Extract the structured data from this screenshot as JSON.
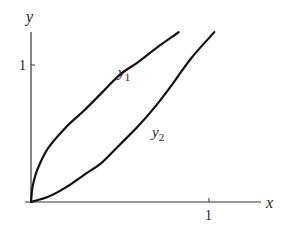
{
  "chart_data": {
    "type": "line",
    "title": "",
    "xlabel": "x",
    "ylabel": "y",
    "x_ticks": [
      "1"
    ],
    "y_ticks": [
      "1"
    ],
    "xlim": [
      0,
      1.25
    ],
    "ylim": [
      0,
      1.25
    ],
    "grid": false,
    "legend": "inline labels",
    "series": [
      {
        "name": "y1",
        "label_main": "y",
        "label_sub": "1",
        "points": [
          [
            0,
            0
          ],
          [
            0.01,
            0.12
          ],
          [
            0.04,
            0.25
          ],
          [
            0.1,
            0.4
          ],
          [
            0.2,
            0.55
          ],
          [
            0.3,
            0.67
          ],
          [
            0.4,
            0.8
          ],
          [
            0.5,
            0.93
          ],
          [
            0.6,
            1.02
          ],
          [
            0.7,
            1.12
          ],
          [
            0.83,
            1.24
          ]
        ]
      },
      {
        "name": "y2",
        "label_main": "y",
        "label_sub": "2",
        "points": [
          [
            0,
            0
          ],
          [
            0.1,
            0.04
          ],
          [
            0.2,
            0.11
          ],
          [
            0.3,
            0.2
          ],
          [
            0.4,
            0.29
          ],
          [
            0.5,
            0.42
          ],
          [
            0.6,
            0.55
          ],
          [
            0.7,
            0.7
          ],
          [
            0.8,
            0.87
          ],
          [
            0.9,
            1.05
          ],
          [
            1.03,
            1.24
          ]
        ]
      }
    ]
  }
}
